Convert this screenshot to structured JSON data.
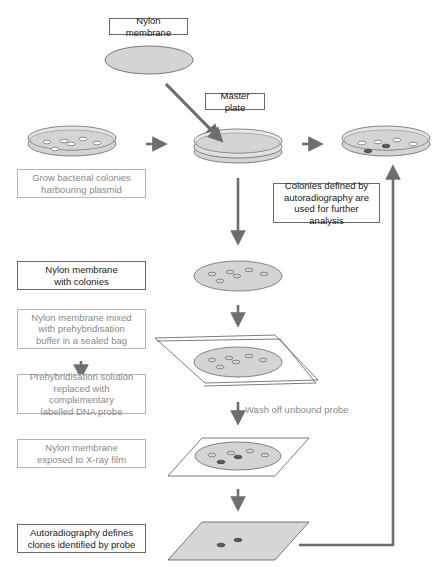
{
  "diagram": {
    "colors": {
      "arrow": "#6e6e6e",
      "dish_fill": "#d4d4d4",
      "colony_outline": "#555555",
      "positive_colony": "#5a5a5a",
      "film_fill": "#d6d6d6",
      "dark_box_border": "#6a6a6a",
      "light_box_border": "#b4b4b4",
      "light_text": "#8a8a8a",
      "dark_text": "#1a1a1a"
    },
    "labels": {
      "nylon_membrane": "Nylon membrane",
      "master_plate": "Master plate",
      "grow_colonies_line1": "Grow bacterial colonies",
      "grow_colonies_line2": "harbouring plasmid",
      "colonies_defined_line1": "Colonies defined by",
      "colonies_defined_line2": "autoradiography are",
      "colonies_defined_line3": "used for further analysis",
      "membrane_colonies_line1": "Nylon membrane",
      "membrane_colonies_line2": "with colonies",
      "prehyb_bag_line1": "Nylon membrane mixed",
      "prehyb_bag_line2": "with prehybridisation",
      "prehyb_bag_line3": "buffer in a sealed bag",
      "probe_line1": "Prehybridisation solution",
      "probe_line2": "replaced with complementary",
      "probe_line3": "labelled DNA probe",
      "wash": "Wash off unbound probe",
      "xray_line1": "Nylon membrane",
      "xray_line2": "exposed to X-ray film",
      "autorad_line1": "Autoradiography defines",
      "autorad_line2": "clones identified by probe"
    },
    "steps": [
      {
        "id": "grow",
        "style": "light"
      },
      {
        "id": "membrane-colonies",
        "style": "dark"
      },
      {
        "id": "prehyb-bag",
        "style": "light"
      },
      {
        "id": "probe",
        "style": "light"
      },
      {
        "id": "xray",
        "style": "light"
      },
      {
        "id": "autorad",
        "style": "dark"
      },
      {
        "id": "colonies-defined",
        "style": "dark"
      }
    ]
  }
}
